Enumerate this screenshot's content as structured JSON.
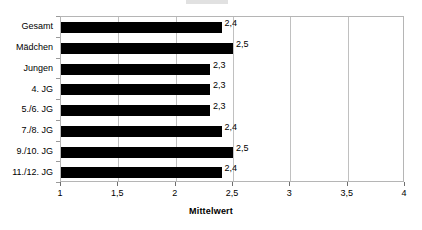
{
  "chart_data": {
    "type": "bar",
    "orientation": "horizontal",
    "title": "",
    "xlabel": "Mittelwert",
    "ylabel": "",
    "xlim": [
      1,
      4
    ],
    "xticks": [
      1,
      1.5,
      2,
      2.5,
      3,
      3.5,
      4
    ],
    "xtick_labels": [
      "1",
      "1,5",
      "2",
      "2,5",
      "3",
      "3,5",
      "4"
    ],
    "grid": true,
    "gridlines_at": [
      1.5,
      2,
      2.5,
      3,
      3.5
    ],
    "legend": "none",
    "bar_color": "#000000",
    "categories": [
      "Gesamt",
      "Mädchen",
      "Jungen",
      "4. JG",
      "5./6. JG",
      "7./8. JG",
      "9./10. JG",
      "11./12. JG"
    ],
    "values": [
      2.4,
      2.5,
      2.3,
      2.3,
      2.3,
      2.4,
      2.5,
      2.4
    ],
    "value_labels": [
      "2,4",
      "2,5",
      "2,3",
      "2,3",
      "2,3",
      "2,4",
      "2,5",
      "2,4"
    ],
    "bars": [
      {
        "category": "Gesamt",
        "value": 2.4,
        "label": "2,4"
      },
      {
        "category": "Mädchen",
        "value": 2.5,
        "label": "2,5"
      },
      {
        "category": "Jungen",
        "value": 2.3,
        "label": "2,3"
      },
      {
        "category": "4. JG",
        "value": 2.3,
        "label": "2,3"
      },
      {
        "category": "5./6. JG",
        "value": 2.3,
        "label": "2,3"
      },
      {
        "category": "7./8. JG",
        "value": 2.4,
        "label": "2,4"
      },
      {
        "category": "9./10. JG",
        "value": 2.5,
        "label": "2,5"
      },
      {
        "category": "11./12. JG",
        "value": 2.4,
        "label": "2,4"
      }
    ]
  },
  "axis": {
    "x_title": "Mittelwert"
  },
  "colors": {
    "bar": "#000000",
    "grid": "#c0c0c0",
    "border": "#b5b5b5",
    "plot_background": "#ffffff"
  }
}
